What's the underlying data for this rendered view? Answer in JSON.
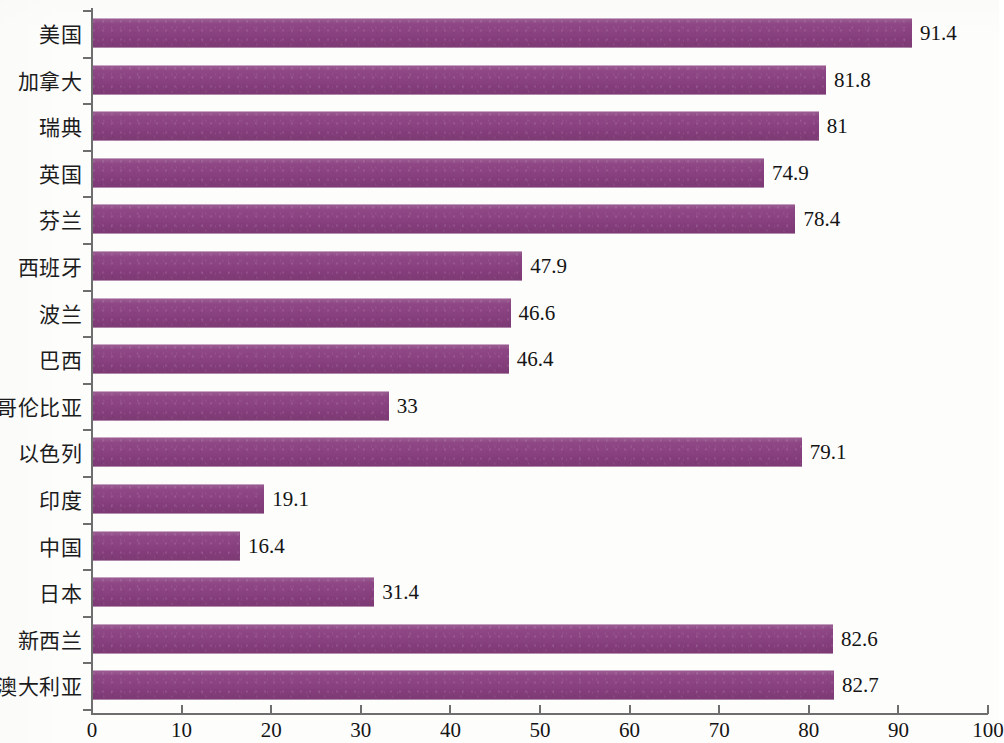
{
  "chart_data": {
    "type": "bar",
    "orientation": "horizontal",
    "title": "",
    "subtitle": "",
    "xlabel": "",
    "ylabel": "",
    "xlim": [
      0,
      100
    ],
    "ylim": null,
    "grid": false,
    "legend": null,
    "legend_position": "none",
    "bar_color": "#8c4182",
    "axis_color": "#6e6e6e",
    "background_color": "#fdfdfc",
    "text_color": "#141414",
    "xticks": [
      0,
      10,
      20,
      30,
      40,
      50,
      60,
      70,
      80,
      90,
      100
    ],
    "xtick_labels": [
      "0",
      "10",
      "20",
      "30",
      "40",
      "50",
      "60",
      "70",
      "80",
      "90",
      "100"
    ],
    "categories": [
      "美国",
      "加拿大",
      "瑞典",
      "英国",
      "芬兰",
      "西班牙",
      "波兰",
      "巴西",
      "哥伦比亚",
      "以色列",
      "印度",
      "中国",
      "日本",
      "新西兰",
      "澳大利亚"
    ],
    "values": [
      91.4,
      81.8,
      81,
      74.9,
      78.4,
      47.9,
      46.6,
      46.4,
      33,
      79.1,
      19.1,
      16.4,
      31.4,
      82.6,
      82.7
    ],
    "value_labels": [
      "91.4",
      "81.8",
      "81",
      "74.9",
      "78.4",
      "47.9",
      "46.6",
      "46.4",
      "33",
      "79.1",
      "19.1",
      "16.4",
      "31.4",
      "82.6",
      "82.7"
    ],
    "series": [
      {
        "name": "",
        "values": [
          91.4,
          81.8,
          81,
          74.9,
          78.4,
          47.9,
          46.6,
          46.4,
          33,
          79.1,
          19.1,
          16.4,
          31.4,
          82.6,
          82.7
        ]
      }
    ]
  }
}
